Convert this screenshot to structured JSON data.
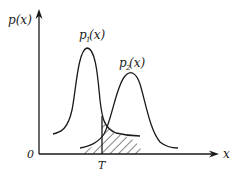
{
  "diagram": {
    "y_axis_label": "p(x)",
    "x_axis_label": "x",
    "origin_label": "0",
    "threshold_label": "T",
    "curves": [
      {
        "name": "p1",
        "label_base": "p",
        "label_sub": "1",
        "label_arg": "(x)"
      },
      {
        "name": "p2",
        "label_base": "p",
        "label_sub": "2",
        "label_arg": "(x)"
      }
    ],
    "colors": {
      "stroke": "#1a1a1a",
      "background": "#ffffff"
    }
  }
}
